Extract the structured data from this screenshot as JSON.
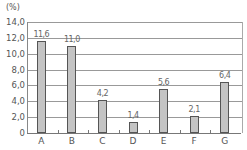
{
  "chart_data": {
    "type": "bar",
    "title": "",
    "xlabel": "",
    "ylabel": "(%)",
    "unit_label": "(%)",
    "categories": [
      "A",
      "B",
      "C",
      "D",
      "E",
      "F",
      "G"
    ],
    "values": [
      11.6,
      11.0,
      4.2,
      1.4,
      5.6,
      2.1,
      6.4
    ],
    "value_labels": [
      "11.6",
      "11.0",
      "4.2",
      "1.4",
      "5.6",
      "2.1",
      "6.4"
    ],
    "ylim": [
      0,
      14
    ],
    "yticks": [
      "0",
      "2.0",
      "4.0",
      "6.0",
      "8.0",
      "10.0",
      "12.0",
      "14.0"
    ],
    "grid": true,
    "legend": null,
    "bar_color": "#c4c4c4",
    "bar_edge_color": "#555555"
  }
}
